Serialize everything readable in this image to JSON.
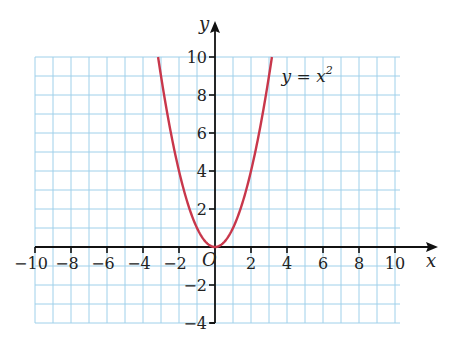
{
  "chart_data": {
    "type": "line",
    "title": "",
    "xlabel": "x",
    "ylabel": "y",
    "xlim": [
      -10,
      10
    ],
    "ylim": [
      -4,
      10
    ],
    "grid": true,
    "grid_step": 1,
    "x_ticks": [
      -10,
      -8,
      -6,
      -4,
      -2,
      2,
      4,
      6,
      8,
      10
    ],
    "x_tick_labels": [
      "−10",
      "−8",
      "−6",
      "−4",
      "−2",
      "2",
      "4",
      "6",
      "8",
      "10"
    ],
    "y_ticks": [
      10,
      8,
      6,
      4,
      2,
      -2,
      -4
    ],
    "y_tick_labels": [
      "10",
      "8",
      "6",
      "4",
      "2",
      "−2",
      "−4"
    ],
    "origin_label": "O",
    "series": [
      {
        "name": "y = x²",
        "function": "x^2",
        "domain": [
          -3.162,
          3.162
        ],
        "x": [
          -3.162,
          -3,
          -2.5,
          -2,
          -1.5,
          -1,
          -0.5,
          0,
          0.5,
          1,
          1.5,
          2,
          2.5,
          3,
          3.162
        ],
        "y": [
          10,
          9,
          6.25,
          4,
          2.25,
          1,
          0.25,
          0,
          0.25,
          1,
          2.25,
          4,
          6.25,
          9,
          10
        ],
        "color": "#c8374b"
      }
    ],
    "annotations": [
      {
        "text": "y = x",
        "superscript": "2",
        "x": 3.7,
        "y": 8.7
      }
    ],
    "colors": {
      "grid": "#9fd0ea",
      "axis": "#111111",
      "curve": "#c8374b"
    }
  }
}
